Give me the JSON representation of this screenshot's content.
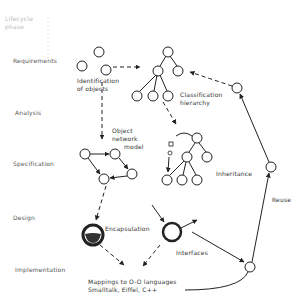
{
  "diagram": {
    "header": {
      "line1": "Lifecycle",
      "line2": "phase"
    },
    "phases": [
      {
        "label": "Requirements"
      },
      {
        "label": "Analysis"
      },
      {
        "label": "Specification"
      },
      {
        "label": "Design"
      },
      {
        "label": "Implementation"
      }
    ],
    "annotations": {
      "identification": [
        "Identification",
        "of objects"
      ],
      "classification": [
        "Classification",
        "hierarchy"
      ],
      "object_network": [
        "Object",
        "network",
        "model"
      ],
      "inheritance": "Inheritance",
      "reuse": "Reuse",
      "encapsulation": "Encapsulation",
      "interfaces": "Interfaces",
      "mappings": [
        "Mappings to O-O languages",
        "Smalltalk, Eiffel, C++"
      ]
    },
    "colors": {
      "ink": "#222222",
      "background": "#ffffff"
    }
  }
}
